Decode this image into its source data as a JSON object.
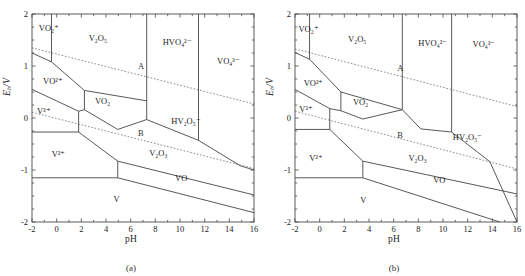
{
  "figure": {
    "panels": [
      {
        "id": "a",
        "caption": "(a)",
        "axes": {
          "xlabel": "pH",
          "ylabel_prefix": "E",
          "ylabel_sub": "h",
          "ylabel_suffix": "/V",
          "xlim": [
            -2,
            16
          ],
          "ylim": [
            -2,
            2
          ],
          "xticks": [
            -2,
            0,
            2,
            4,
            6,
            8,
            10,
            12,
            14,
            16
          ],
          "yticks": [
            2,
            1,
            0,
            -1,
            -2
          ],
          "xminor_step": 1,
          "yminor_step": 0.25,
          "grid": false
        },
        "line_labels": [
          {
            "name": "A",
            "text": "A",
            "x": 6.6,
            "y": 1.0
          },
          {
            "name": "B",
            "text": "B",
            "x": 6.6,
            "y": -0.28
          }
        ],
        "regions": [
          {
            "name": "vo2-plus",
            "text": "VO₂⁺",
            "x": -1.45,
            "y": 1.72
          },
          {
            "name": "v2o5",
            "text": "V₂O₅",
            "x": 2.6,
            "y": 1.52
          },
          {
            "name": "hvo4-2m",
            "text": "HVO₄²⁻",
            "x": 8.6,
            "y": 1.45
          },
          {
            "name": "vo4-3m",
            "text": "VO₄³⁻",
            "x": 13.0,
            "y": 1.08
          },
          {
            "name": "vo-2plus",
            "text": "VO²⁺",
            "x": -1.1,
            "y": 0.7
          },
          {
            "name": "v-3plus",
            "text": "V³⁺",
            "x": -1.6,
            "y": 0.12
          },
          {
            "name": "vo2-solid",
            "text": "VO₂",
            "x": 3.1,
            "y": 0.3
          },
          {
            "name": "hv2o5-m",
            "text": "HV₂O₅⁻",
            "x": 9.3,
            "y": -0.07
          },
          {
            "name": "v-2plus",
            "text": "V²⁺",
            "x": -0.4,
            "y": -0.72
          },
          {
            "name": "v2o3",
            "text": "V₂O₃",
            "x": 7.5,
            "y": -0.7
          },
          {
            "name": "vo-solid",
            "text": "VO",
            "x": 9.6,
            "y": -1.18
          },
          {
            "name": "v-metal",
            "text": "V",
            "x": 4.6,
            "y": -1.58
          }
        ],
        "boundaries": {
          "water_A": [
            [
              -2,
              1.35
            ],
            [
              16,
              0.27
            ]
          ],
          "water_B": [
            [
              -2,
              0.11
            ],
            [
              16,
              -0.97
            ]
          ],
          "solid_lines": [
            [
              [
                -0.42,
                2.0
              ],
              [
                -0.42,
                1.08
              ]
            ],
            [
              [
                -2,
                1.25
              ],
              [
                -0.42,
                1.08
              ],
              [
                2.25,
                0.53
              ]
            ],
            [
              [
                2.25,
                0.53
              ],
              [
                2.25,
                0.16
              ]
            ],
            [
              [
                2.25,
                0.53
              ],
              [
                7.3,
                0.33
              ]
            ],
            [
              [
                -2,
                0.55
              ],
              [
                1.78,
                0.13
              ],
              [
                2.25,
                0.16
              ]
            ],
            [
              [
                2.25,
                0.16
              ],
              [
                4.95,
                -0.22
              ],
              [
                7.3,
                -0.03
              ]
            ],
            [
              [
                7.3,
                2.0
              ],
              [
                7.3,
                0.33
              ]
            ],
            [
              [
                7.3,
                0.33
              ],
              [
                7.3,
                -0.03
              ]
            ],
            [
              [
                7.3,
                -0.03
              ],
              [
                11.5,
                -0.43
              ],
              [
                14.9,
                -0.92
              ]
            ],
            [
              [
                11.5,
                2.0
              ],
              [
                11.5,
                -0.43
              ]
            ],
            [
              [
                14.9,
                -0.92
              ],
              [
                16,
                -1.0
              ]
            ],
            [
              [
                -2,
                -0.27
              ],
              [
                1.78,
                -0.27
              ]
            ],
            [
              [
                1.78,
                0.13
              ],
              [
                1.78,
                -0.27
              ]
            ],
            [
              [
                1.78,
                -0.27
              ],
              [
                4.95,
                -0.83
              ],
              [
                16,
                -1.48
              ]
            ],
            [
              [
                -2,
                -1.15
              ],
              [
                4.95,
                -1.15
              ]
            ],
            [
              [
                4.95,
                -0.83
              ],
              [
                4.95,
                -1.15
              ]
            ],
            [
              [
                4.95,
                -1.15
              ],
              [
                16,
                -1.82
              ]
            ]
          ]
        }
      },
      {
        "id": "b",
        "caption": "(b)",
        "axes": {
          "xlabel": "pH",
          "ylabel_prefix": "E",
          "ylabel_sub": "h",
          "ylabel_suffix": "/V",
          "xlim": [
            -2,
            16
          ],
          "ylim": [
            -2,
            2
          ],
          "xticks": [
            -2,
            0,
            2,
            4,
            6,
            8,
            10,
            12,
            14,
            16
          ],
          "yticks": [
            2,
            1,
            0,
            -1,
            -2
          ],
          "xminor_step": 1,
          "yminor_step": 0.25,
          "grid": false
        },
        "line_labels": [
          {
            "name": "A",
            "text": "A",
            "x": 6.3,
            "y": 0.96
          },
          {
            "name": "B",
            "text": "B",
            "x": 6.3,
            "y": -0.32
          }
        ],
        "regions": [
          {
            "name": "vo2-plus",
            "text": "VO₂⁺",
            "x": -1.72,
            "y": 1.7
          },
          {
            "name": "v2o5",
            "text": "V₂O₅",
            "x": 2.3,
            "y": 1.5
          },
          {
            "name": "hvo4-2m",
            "text": "HVO₄²⁻",
            "x": 8.0,
            "y": 1.42
          },
          {
            "name": "vo4-3m",
            "text": "VO₄³⁻",
            "x": 12.4,
            "y": 1.4
          },
          {
            "name": "vo-2plus",
            "text": "VO²⁺",
            "x": -1.3,
            "y": 0.66
          },
          {
            "name": "v-3plus",
            "text": "V³⁺",
            "x": -1.65,
            "y": 0.15
          },
          {
            "name": "vo2-solid",
            "text": "VO₂",
            "x": 2.7,
            "y": 0.28
          },
          {
            "name": "hv2o5-m",
            "text": "HV₂O₅⁻",
            "x": 10.8,
            "y": -0.38
          },
          {
            "name": "v-2plus",
            "text": "V²⁺",
            "x": -0.85,
            "y": -0.78
          },
          {
            "name": "v2o3",
            "text": "V₂O₃",
            "x": 7.2,
            "y": -0.78
          },
          {
            "name": "vo-solid",
            "text": "VO",
            "x": 9.2,
            "y": -1.22
          },
          {
            "name": "v-metal",
            "text": "V",
            "x": 3.3,
            "y": -1.6
          }
        ],
        "boundaries": {
          "water_A": [
            [
              -2,
              1.33
            ],
            [
              16,
              0.22
            ]
          ],
          "water_B": [
            [
              -2,
              0.13
            ],
            [
              16,
              -0.98
            ]
          ],
          "solid_lines": [
            [
              [
                -0.82,
                2.0
              ],
              [
                -0.82,
                1.13
              ]
            ],
            [
              [
                -2,
                1.26
              ],
              [
                -0.82,
                1.13
              ],
              [
                1.72,
                0.5
              ]
            ],
            [
              [
                1.72,
                0.5
              ],
              [
                1.72,
                0.14
              ]
            ],
            [
              [
                1.72,
                0.5
              ],
              [
                6.7,
                0.16
              ]
            ],
            [
              [
                -2,
                0.55
              ],
              [
                0.82,
                0.18
              ],
              [
                1.72,
                0.14
              ]
            ],
            [
              [
                1.72,
                0.14
              ],
              [
                3.5,
                -0.02
              ],
              [
                6.7,
                0.16
              ]
            ],
            [
              [
                6.7,
                2.0
              ],
              [
                6.7,
                0.16
              ]
            ],
            [
              [
                6.7,
                0.16
              ],
              [
                8.2,
                -0.21
              ],
              [
                10.7,
                -0.27
              ]
            ],
            [
              [
                10.7,
                2.0
              ],
              [
                10.7,
                -0.27
              ]
            ],
            [
              [
                10.7,
                -0.27
              ],
              [
                13.8,
                -0.84
              ],
              [
                16,
                -2.0
              ]
            ],
            [
              [
                -2,
                -0.22
              ],
              [
                0.82,
                -0.22
              ]
            ],
            [
              [
                0.82,
                0.18
              ],
              [
                0.82,
                -0.22
              ]
            ],
            [
              [
                0.82,
                -0.22
              ],
              [
                3.5,
                -0.83
              ],
              [
                16,
                -1.46
              ]
            ],
            [
              [
                -2,
                -1.15
              ],
              [
                3.5,
                -1.15
              ]
            ],
            [
              [
                3.5,
                -0.83
              ],
              [
                3.5,
                -1.15
              ]
            ],
            [
              [
                3.5,
                -1.15
              ],
              [
                14.6,
                -2.0
              ]
            ]
          ]
        }
      }
    ],
    "colors": {
      "axis": "#4a4a4a",
      "boundary": "#3a3a3a",
      "water_line": "#6b6b6b",
      "text": "#1a1a1a",
      "background": "#ffffff"
    }
  }
}
